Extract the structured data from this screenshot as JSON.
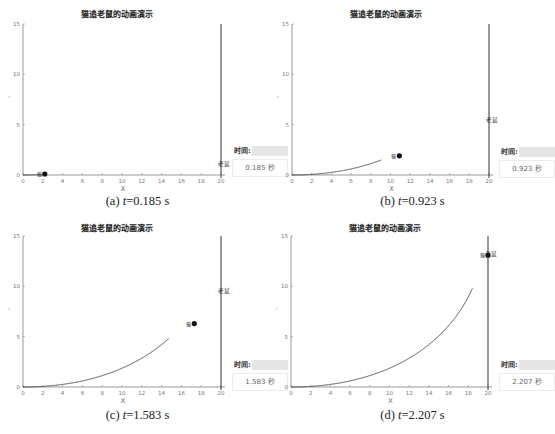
{
  "figure": {
    "chart_data": [
      {
        "type": "line",
        "panel": "a",
        "title": "猫追老鼠的动画演示",
        "xlabel": "X",
        "ylabel": "Y",
        "xlim": [
          0,
          20
        ],
        "ylim": [
          0,
          15
        ],
        "xticks": [
          0,
          2,
          4,
          6,
          8,
          10,
          12,
          14,
          16,
          18,
          20
        ],
        "yticks": [
          0,
          5,
          10,
          15
        ],
        "mouse_line_x": 20,
        "t": 0.185,
        "cat_position": [
          2.2,
          0.1
        ],
        "mouse_position": [
          20,
          1.1
        ],
        "cat_label": "猫",
        "mouse_label": "老鼠",
        "time_label": "时间:",
        "time_value": "0.185 秒",
        "caption_prefix": "(a) ",
        "caption_var": "t",
        "caption_value": "=0.185 s"
      },
      {
        "type": "line",
        "panel": "b",
        "title": "猫追老鼠的动画演示",
        "xlabel": "X",
        "ylabel": "Y",
        "xlim": [
          0,
          20
        ],
        "ylim": [
          0,
          15
        ],
        "xticks": [
          0,
          2,
          4,
          6,
          8,
          10,
          12,
          14,
          16,
          18,
          20
        ],
        "yticks": [
          0,
          5,
          10,
          15
        ],
        "mouse_line_x": 20,
        "t": 0.923,
        "cat_position": [
          10.9,
          1.9
        ],
        "mouse_position": [
          20,
          5.5
        ],
        "cat_label": "猫",
        "mouse_label": "老鼠",
        "time_label": "时间:",
        "time_value": "0.923 秒",
        "caption_prefix": "(b) ",
        "caption_var": "t",
        "caption_value": "=0.923 s"
      },
      {
        "type": "line",
        "panel": "c",
        "title": "猫追老鼠的动画演示",
        "xlabel": "X",
        "ylabel": "Y",
        "xlim": [
          0,
          20
        ],
        "ylim": [
          0,
          15
        ],
        "xticks": [
          0,
          2,
          4,
          6,
          8,
          10,
          12,
          14,
          16,
          18,
          20
        ],
        "yticks": [
          0,
          5,
          10,
          15
        ],
        "mouse_line_x": 20,
        "t": 1.583,
        "cat_position": [
          17.3,
          6.3
        ],
        "mouse_position": [
          20,
          9.5
        ],
        "cat_label": "猫",
        "mouse_label": "老鼠",
        "time_label": "时间:",
        "time_value": "1.583 秒",
        "caption_prefix": "(c) ",
        "caption_var": "t",
        "caption_value": "=1.583 s"
      },
      {
        "type": "line",
        "panel": "d",
        "title": "猫追老鼠的动画演示",
        "xlabel": "X",
        "ylabel": "Y",
        "xlim": [
          0,
          20
        ],
        "ylim": [
          0,
          15
        ],
        "xticks": [
          0,
          2,
          4,
          6,
          8,
          10,
          12,
          14,
          16,
          18,
          20
        ],
        "yticks": [
          0,
          5,
          10,
          15
        ],
        "mouse_line_x": 20,
        "t": 2.207,
        "cat_position": [
          20,
          13.1
        ],
        "mouse_position": [
          20,
          13.2
        ],
        "cat_label": "猫",
        "mouse_label": "老鼠",
        "time_label": "时间:",
        "time_value": "2.207 秒",
        "caption_prefix": "(d) ",
        "caption_var": "t",
        "caption_value": "=2.207 s"
      }
    ],
    "model": {
      "cat_start": [
        0,
        0
      ],
      "mouse_start": [
        20,
        0
      ],
      "mouse_speed": 6,
      "cat_speed": 10
    }
  }
}
